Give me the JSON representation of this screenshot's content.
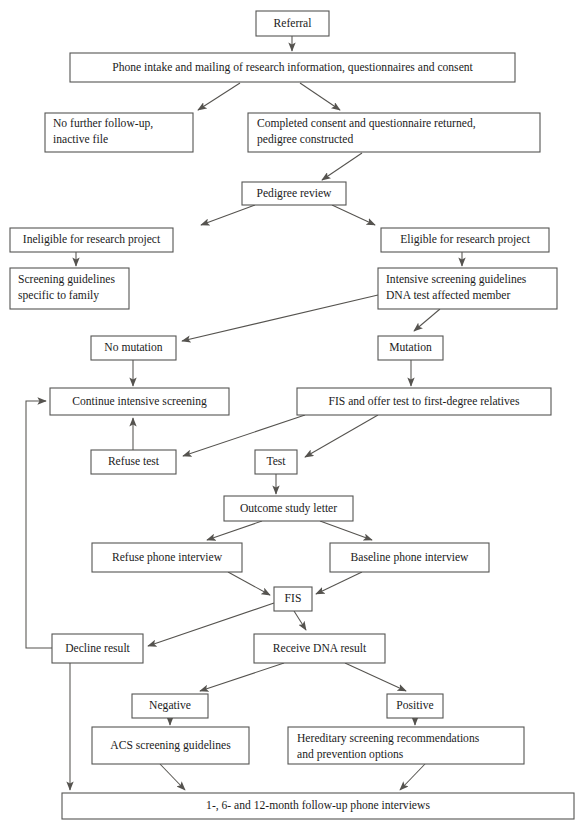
{
  "diagram": {
    "background_color": "#ffffff",
    "box_border_color": "#555553",
    "line_color": "#55534f",
    "text_color": "#1b1b1b"
  },
  "nodes": {
    "referral": {
      "label": "Referral",
      "x": 256,
      "y": 11,
      "w": 73,
      "h": 25,
      "align": "center"
    },
    "phone_intake": {
      "label": "Phone intake and mailing of research information, questionnaires and consent",
      "x": 70,
      "y": 53,
      "w": 445,
      "h": 29,
      "align": "center"
    },
    "no_follow_up_line1": {
      "label": "No further follow-up,",
      "x": 45,
      "y": 113,
      "w": 148,
      "h": 39,
      "align": "left"
    },
    "no_follow_up_line2": {
      "label": "inactive file"
    },
    "completed_consent_line1": {
      "label": "Completed consent and questionnaire returned,",
      "x": 248,
      "y": 113,
      "w": 292,
      "h": 39,
      "align": "left"
    },
    "completed_consent_line2": {
      "label": "pedigree constructed"
    },
    "pedigree_review": {
      "label": "Pedigree review",
      "x": 242,
      "y": 182,
      "w": 104,
      "h": 23,
      "align": "center"
    },
    "ineligible": {
      "label": "Ineligible for research project",
      "x": 10,
      "y": 228,
      "w": 163,
      "h": 24,
      "align": "center"
    },
    "eligible": {
      "label": "Eligible for research project",
      "x": 381,
      "y": 228,
      "w": 168,
      "h": 24,
      "align": "center"
    },
    "screening_guidelines_line1": {
      "label": "Screening guidelines",
      "x": 10,
      "y": 268,
      "w": 119,
      "h": 41,
      "align": "left"
    },
    "screening_guidelines_line2": {
      "label": "specific to family"
    },
    "intensive_screening_line1": {
      "label": "Intensive screening guidelines",
      "x": 378,
      "y": 268,
      "w": 179,
      "h": 41,
      "align": "left"
    },
    "intensive_screening_line2": {
      "label": "DNA test affected member"
    },
    "no_mutation": {
      "label": "No mutation",
      "x": 91,
      "y": 336,
      "w": 85,
      "h": 24,
      "align": "center"
    },
    "mutation": {
      "label": "Mutation",
      "x": 378,
      "y": 336,
      "w": 65,
      "h": 24,
      "align": "center"
    },
    "continue_screening": {
      "label": "Continue intensive screening",
      "x": 50,
      "y": 388,
      "w": 179,
      "h": 27,
      "align": "center"
    },
    "fis_offer_test": {
      "label": "FIS and offer test to first-degree relatives",
      "x": 297,
      "y": 388,
      "w": 254,
      "h": 27,
      "align": "center"
    },
    "refuse_test": {
      "label": "Refuse test",
      "x": 91,
      "y": 450,
      "w": 85,
      "h": 24,
      "align": "center"
    },
    "test": {
      "label": "Test",
      "x": 255,
      "y": 450,
      "w": 42,
      "h": 24,
      "align": "center"
    },
    "outcome_letter": {
      "label": "Outcome study letter",
      "x": 224,
      "y": 496,
      "w": 129,
      "h": 25,
      "align": "center"
    },
    "refuse_phone": {
      "label": "Refuse phone interview",
      "x": 92,
      "y": 543,
      "w": 150,
      "h": 29,
      "align": "center"
    },
    "baseline_phone": {
      "label": "Baseline phone interview",
      "x": 330,
      "y": 543,
      "w": 159,
      "h": 29,
      "align": "center"
    },
    "fis": {
      "label": "FIS",
      "x": 274,
      "y": 587,
      "w": 38,
      "h": 24,
      "align": "center"
    },
    "decline_result": {
      "label": "Decline result",
      "x": 52,
      "y": 634,
      "w": 91,
      "h": 29,
      "align": "center"
    },
    "receive_dna_result": {
      "label": "Receive DNA result",
      "x": 254,
      "y": 634,
      "w": 131,
      "h": 29,
      "align": "center"
    },
    "negative": {
      "label": "Negative",
      "x": 132,
      "y": 694,
      "w": 76,
      "h": 24,
      "align": "center"
    },
    "positive": {
      "label": "Positive",
      "x": 387,
      "y": 694,
      "w": 56,
      "h": 24,
      "align": "center"
    },
    "acs_guidelines": {
      "label": "ACS screening guidelines",
      "x": 92,
      "y": 727,
      "w": 157,
      "h": 37,
      "align": "center"
    },
    "hereditary_line1": {
      "label": "Hereditary screening recommendations",
      "x": 288,
      "y": 727,
      "w": 236,
      "h": 37,
      "align": "left"
    },
    "hereditary_line2": {
      "label": "and prevention options"
    },
    "followup_interviews": {
      "label": "1-, 6- and 12-month follow-up phone interviews",
      "x": 62,
      "y": 793,
      "w": 512,
      "h": 26,
      "align": "center"
    }
  },
  "edges": [
    {
      "from": "referral",
      "to": "phone_intake",
      "kind": "vertical-arrow"
    },
    {
      "from": "phone_intake",
      "to": "no_follow_up",
      "kind": "diagonal-arrow"
    },
    {
      "from": "phone_intake",
      "to": "completed_consent",
      "kind": "diagonal-arrow"
    },
    {
      "from": "completed_consent",
      "to": "pedigree_review",
      "kind": "diagonal-arrow"
    },
    {
      "from": "pedigree_review",
      "to": "ineligible",
      "kind": "diagonal-arrow"
    },
    {
      "from": "pedigree_review",
      "to": "eligible",
      "kind": "diagonal-arrow"
    },
    {
      "from": "ineligible",
      "to": "screening_guidelines",
      "kind": "vertical-arrow"
    },
    {
      "from": "eligible",
      "to": "intensive_screening",
      "kind": "vertical-arrow"
    },
    {
      "from": "intensive_screening",
      "to": "no_mutation",
      "kind": "diagonal-arrow"
    },
    {
      "from": "intensive_screening",
      "to": "mutation",
      "kind": "diagonal-arrow"
    },
    {
      "from": "no_mutation",
      "to": "continue_screening",
      "kind": "vertical-arrow"
    },
    {
      "from": "mutation",
      "to": "fis_offer_test",
      "kind": "vertical-arrow"
    },
    {
      "from": "fis_offer_test",
      "to": "refuse_test_area",
      "kind": "diagonal-arrow"
    },
    {
      "from": "fis_offer_test",
      "to": "test",
      "kind": "diagonal-arrow"
    },
    {
      "from": "refuse_test",
      "to": "continue_screening",
      "kind": "vertical-arrow"
    },
    {
      "from": "test",
      "to": "outcome_letter",
      "kind": "vertical-arrow"
    },
    {
      "from": "outcome_letter",
      "to": "refuse_phone",
      "kind": "diagonal-arrow"
    },
    {
      "from": "outcome_letter",
      "to": "baseline_phone",
      "kind": "diagonal-arrow"
    },
    {
      "from": "refuse_phone",
      "to": "fis",
      "kind": "diagonal-arrow"
    },
    {
      "from": "baseline_phone",
      "to": "fis",
      "kind": "diagonal-arrow"
    },
    {
      "from": "fis",
      "to": "decline_result",
      "kind": "diagonal-arrow"
    },
    {
      "from": "fis",
      "to": "receive_dna_result",
      "kind": "diagonal-arrow"
    },
    {
      "from": "receive_dna_result",
      "to": "negative",
      "kind": "diagonal-arrow"
    },
    {
      "from": "receive_dna_result",
      "to": "positive",
      "kind": "diagonal-arrow"
    },
    {
      "from": "negative",
      "to": "acs_guidelines",
      "kind": "vertical-arrow"
    },
    {
      "from": "positive",
      "to": "hereditary",
      "kind": "vertical-arrow"
    },
    {
      "from": "acs_guidelines",
      "to": "followup_interviews",
      "kind": "diagonal-arrow"
    },
    {
      "from": "hereditary",
      "to": "followup_interviews",
      "kind": "diagonal-arrow"
    },
    {
      "from": "decline_result",
      "to": "followup_interviews",
      "kind": "vertical-arrow"
    },
    {
      "from": "decline_result",
      "to": "continue_screening",
      "kind": "loop-left"
    }
  ]
}
